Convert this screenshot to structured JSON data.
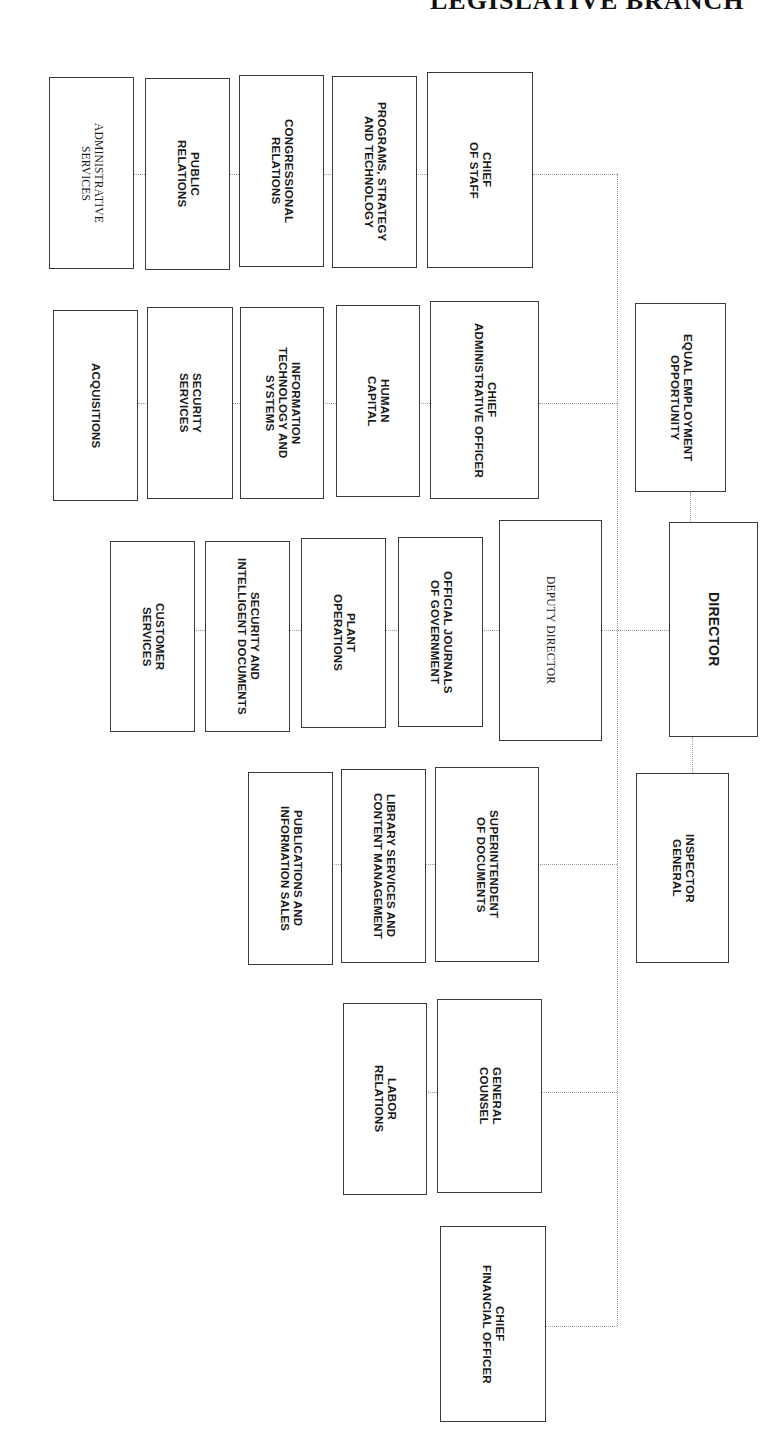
{
  "header": {
    "title": "LEGISLATIVE BRANCH"
  },
  "org_chart": {
    "top": {
      "director": "DIRECTOR",
      "equal_employment_opportunity": "EQUAL EMPLOYMENT\nOPPORTUNITY",
      "inspector_general": "INSPECTOR\nGENERAL"
    },
    "chief_of_staff": {
      "title": "CHIEF\nOF STAFF",
      "units": [
        "PROGRAMS, STRATEGY\nAND TECHNOLOGY",
        "CONGRESSIONAL\nRELATIONS",
        "PUBLIC\nRELATIONS",
        "ADMINISTRATIVE\nSERVICES"
      ]
    },
    "chief_administrative_officer": {
      "title": "CHIEF\nADMINISTRATIVE OFFICER",
      "units": [
        "HUMAN\nCAPITAL",
        "INFORMATION\nTECHNOLOGY AND\nSYSTEMS",
        "SECURITY\nSERVICES",
        "ACQUISITIONS"
      ]
    },
    "deputy_director": {
      "title": "DEPUTY DIRECTOR",
      "units": [
        "OFFICIAL JOURNALS\nOF GOVERNMENT",
        "PLANT\nOPERATIONS",
        "SECURITY AND\nINTELLIGENT DOCUMENTS",
        "CUSTOMER\nSERVICES"
      ]
    },
    "superintendent_of_documents": {
      "title": "SUPERINTENDENT\nOF DOCUMENTS",
      "units": [
        "LIBRARY SERVICES AND\nCONTENT MANAGEMENT",
        "PUBLICATIONS AND\nINFORMATION SALES"
      ]
    },
    "general_counsel": {
      "title": "GENERAL\nCOUNSEL",
      "units": [
        "LABOR\nRELATIONS"
      ]
    },
    "chief_financial_officer": {
      "title": "CHIEF\nFINANCIAL OFFICER"
    }
  },
  "colors": {
    "box_border": "#3a3a3a",
    "connector": "#9a9a9a",
    "background": "#ffffff"
  }
}
